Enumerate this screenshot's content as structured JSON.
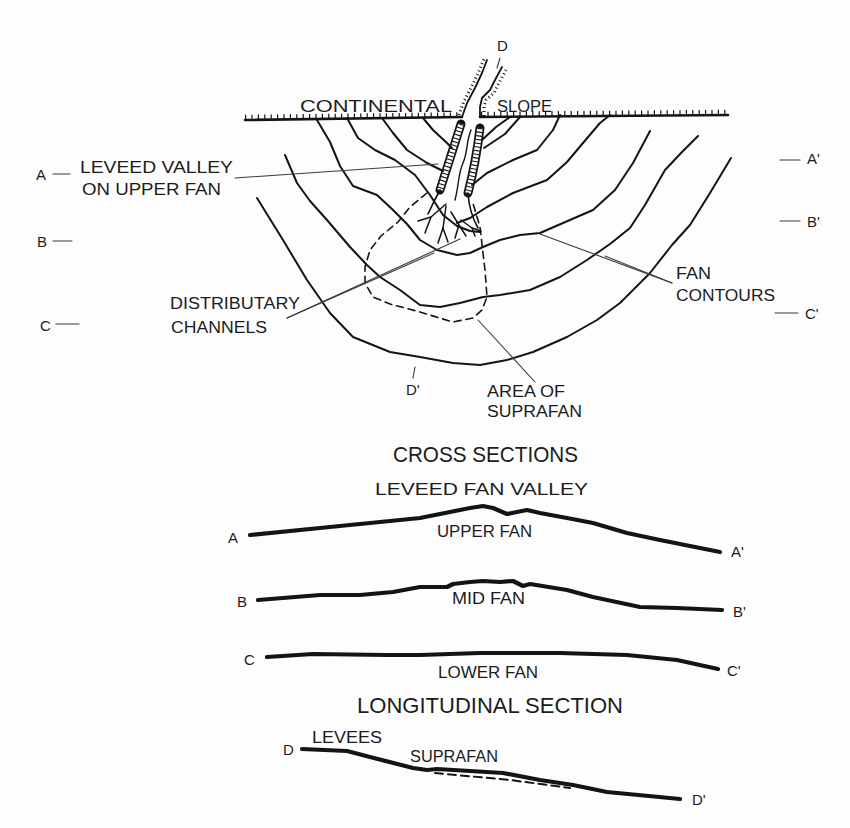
{
  "figure": {
    "plan_view": {
      "channel_label": "D",
      "slope_label_left": "CONTINENTAL",
      "slope_label_right": "SLOPE",
      "markers_left": {
        "a": "A",
        "b": "B",
        "c": "C"
      },
      "markers_right": {
        "a": "A'",
        "b": "B'",
        "c": "C'"
      },
      "leveed_valley": {
        "line1": "LEVEED VALLEY",
        "line2": "ON UPPER FAN"
      },
      "distributary": {
        "line1": "DISTRIBUTARY",
        "line2": "CHANNELS"
      },
      "fan_contours": {
        "line1": "FAN",
        "line2": "CONTOURS"
      },
      "suprafan_area": {
        "line1": "AREA OF",
        "line2": "SUPRAFAN"
      },
      "section_end_label": "D'"
    },
    "cross_sections": {
      "title": "CROSS SECTIONS",
      "valley_label": "LEVEED FAN VALLEY",
      "profiles": [
        {
          "start": "A",
          "end": "A'",
          "label": "UPPER FAN"
        },
        {
          "start": "B",
          "end": "B'",
          "label": "MID FAN"
        },
        {
          "start": "C",
          "end": "C'",
          "label": "LOWER FAN"
        }
      ]
    },
    "longitudinal_section": {
      "title": "LONGITUDINAL SECTION",
      "start": "D",
      "end": "D'",
      "levees_label": "LEVEES",
      "suprafan_label": "SUPRAFAN"
    },
    "colors": {
      "ink": "#141414",
      "background": "#fdfdfd"
    }
  }
}
